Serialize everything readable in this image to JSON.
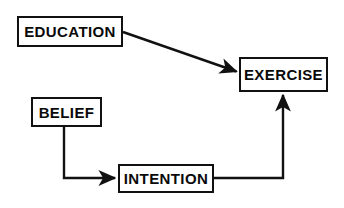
{
  "diagram": {
    "background_color": "#ffffff",
    "line_color": "#111111",
    "text_color": "#0a0a0a",
    "nodes": [
      {
        "id": "education",
        "label": "EDUCATION"
      },
      {
        "id": "exercise",
        "label": "EXERCISE"
      },
      {
        "id": "belief",
        "label": "BELIEF"
      },
      {
        "id": "intention",
        "label": "INTENTION"
      }
    ],
    "edges": [
      {
        "id": "education-to-exercise",
        "from": "EDUCATION",
        "to": "EXERCISE",
        "style": "diagonal-arrow"
      },
      {
        "id": "belief-to-intention",
        "from": "BELIEF",
        "to": "INTENTION",
        "style": "elbow-arrow"
      },
      {
        "id": "intention-to-exercise",
        "from": "INTENTION",
        "to": "EXERCISE",
        "style": "elbow-arrow"
      }
    ]
  }
}
